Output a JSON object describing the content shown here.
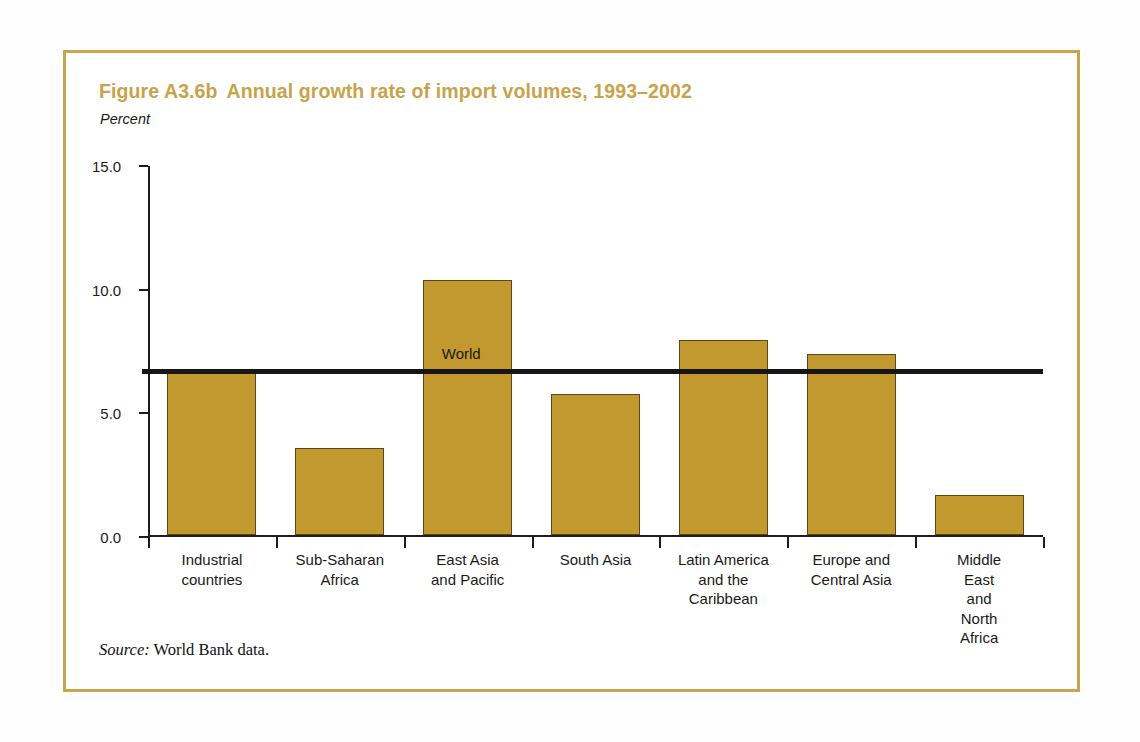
{
  "figure": {
    "number": "Figure A3.6b",
    "title": "Annual growth rate of import volumes, 1993–2002",
    "unit_label": "Percent",
    "source_label": "Source:",
    "source_text": "World Bank data.",
    "frame_color": "#caa44e",
    "title_color": "#c9a24a",
    "bar_color": "#c2992f",
    "bar_edge_color": "#5b4718",
    "reference_line_color": "#161616"
  },
  "chart_data": {
    "type": "bar",
    "xlabel": "",
    "ylabel": "Percent",
    "ylim": [
      0.0,
      15.0
    ],
    "yticks": [
      "0.0",
      "5.0",
      "10.0",
      "15.0"
    ],
    "ytick_values": [
      0.0,
      5.0,
      10.0,
      15.0
    ],
    "grid": false,
    "legend": "none",
    "categories": [
      "Industrial\ncountries",
      "Sub-Saharan\nAfrica",
      "East Asia\nand Pacific",
      "South Asia",
      "Latin America\nand the\nCaribbean",
      "Europe and\nCentral Asia",
      "Middle East\nand\nNorth Africa"
    ],
    "values": [
      6.6,
      3.5,
      10.3,
      5.7,
      7.9,
      7.3,
      1.6
    ],
    "annotations": [
      {
        "name": "world-reference-line",
        "label": "World",
        "value": 6.7,
        "style": "horizontal-line"
      }
    ]
  }
}
